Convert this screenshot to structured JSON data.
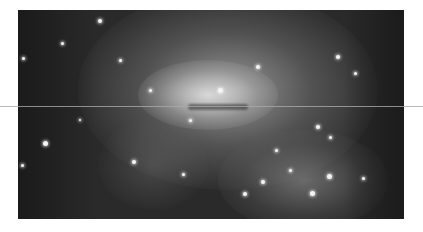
{
  "image": {
    "subject": "irregular-galaxy",
    "colors": {
      "background": "#ffffff",
      "sky": "#2a2a2a",
      "core": "#e6e6e6",
      "scanline": "#a9a9a9"
    },
    "stars": [
      {
        "x": 45,
        "y": 143,
        "r": 2.5
      },
      {
        "x": 23,
        "y": 58,
        "r": 1.5
      },
      {
        "x": 62,
        "y": 43,
        "r": 1.5
      },
      {
        "x": 120,
        "y": 60,
        "r": 1.5
      },
      {
        "x": 100,
        "y": 21,
        "r": 2
      },
      {
        "x": 134,
        "y": 162,
        "r": 2
      },
      {
        "x": 22,
        "y": 165,
        "r": 1.5
      },
      {
        "x": 183,
        "y": 174,
        "r": 1.5
      },
      {
        "x": 258,
        "y": 67,
        "r": 2
      },
      {
        "x": 220,
        "y": 90,
        "r": 2.5
      },
      {
        "x": 338,
        "y": 57,
        "r": 2
      },
      {
        "x": 355,
        "y": 73,
        "r": 1.5
      },
      {
        "x": 312,
        "y": 193,
        "r": 2.5
      },
      {
        "x": 329,
        "y": 176,
        "r": 2.5
      },
      {
        "x": 263,
        "y": 182,
        "r": 2
      },
      {
        "x": 245,
        "y": 194,
        "r": 2
      },
      {
        "x": 290,
        "y": 170,
        "r": 1.5
      },
      {
        "x": 318,
        "y": 127,
        "r": 2
      },
      {
        "x": 330,
        "y": 137,
        "r": 1.5
      },
      {
        "x": 363,
        "y": 178,
        "r": 1.5
      },
      {
        "x": 190,
        "y": 120,
        "r": 1.5
      },
      {
        "x": 276,
        "y": 150,
        "r": 1.5
      },
      {
        "x": 150,
        "y": 90,
        "r": 1.5
      },
      {
        "x": 80,
        "y": 120,
        "r": 1
      }
    ]
  }
}
